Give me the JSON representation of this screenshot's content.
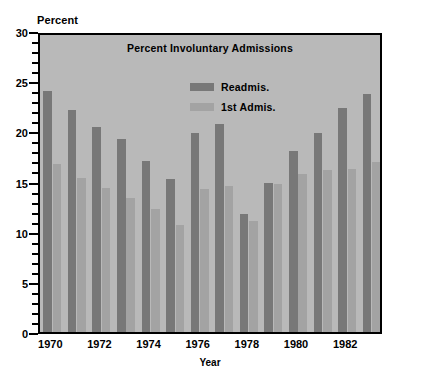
{
  "chart_data": {
    "type": "bar",
    "title": "Percent Involuntary Admissions",
    "xlabel": "Year",
    "ylabel": "Percent",
    "ylim": [
      0,
      30
    ],
    "ytick_values": [
      0,
      5,
      10,
      15,
      20,
      25,
      30
    ],
    "ytick_labels": [
      "0",
      "5",
      "10",
      "15",
      "20",
      "25",
      "30"
    ],
    "yminor_step": 1,
    "grid": false,
    "legend_position": "inside-top-center",
    "categories": [
      1970,
      1971,
      1972,
      1973,
      1974,
      1975,
      1976,
      1977,
      1978,
      1979,
      1980,
      1981,
      1982,
      1983
    ],
    "xtick_labels": [
      "1970",
      "1972",
      "1974",
      "1976",
      "1978",
      "1980",
      "1982"
    ],
    "xtick_categories": [
      1970,
      1972,
      1974,
      1976,
      1978,
      1980,
      1982
    ],
    "series": [
      {
        "name": "Readmis.",
        "color": "#787878",
        "values": [
          24.0,
          22.1,
          20.4,
          19.2,
          17.0,
          15.3,
          19.8,
          20.7,
          11.8,
          14.9,
          18.0,
          19.8,
          22.3,
          23.7
        ]
      },
      {
        "name": "1st Admis.",
        "color": "#a3a3a3",
        "values": [
          16.7,
          15.4,
          14.4,
          13.4,
          12.3,
          10.7,
          14.3,
          14.6,
          11.1,
          14.8,
          15.7,
          16.1,
          16.2,
          16.9
        ]
      }
    ]
  },
  "axis": {
    "y_unit_label": "Percent",
    "x_axis_title": "Year"
  },
  "legend": {
    "items": [
      {
        "label": "Readmis.",
        "color": "#787878"
      },
      {
        "label": "1st Admis.",
        "color": "#a3a3a3"
      }
    ]
  },
  "colors": {
    "plot_background": "#b9b9b9",
    "axis": "#000000",
    "readmis_bar": "#787878",
    "first_admis_bar": "#a3a3a3",
    "page_background": "#ffffff"
  }
}
